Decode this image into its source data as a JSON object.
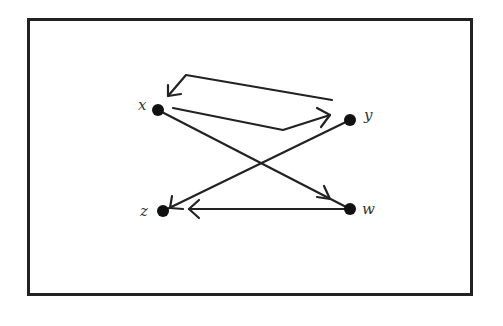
{
  "diagram": {
    "type": "directed-graph",
    "nodes": [
      {
        "id": "x",
        "label": "x",
        "cx": 158,
        "cy": 110
      },
      {
        "id": "y",
        "label": "y",
        "cx": 350,
        "cy": 120
      },
      {
        "id": "z",
        "label": "z",
        "cx": 163,
        "cy": 211
      },
      {
        "id": "w",
        "label": "w",
        "cx": 350,
        "cy": 209
      }
    ],
    "edges": [
      {
        "from": "x",
        "to": "y",
        "style": "bent-arrow"
      },
      {
        "from": "y",
        "to": "x",
        "style": "bent-arrow"
      },
      {
        "from": "x",
        "to": "w",
        "style": "straight"
      },
      {
        "from": "y",
        "to": "z",
        "style": "straight"
      },
      {
        "from": "w",
        "to": "z",
        "style": "straight"
      }
    ],
    "colors": {
      "ink": "#222222",
      "background": "#ffffff"
    }
  }
}
